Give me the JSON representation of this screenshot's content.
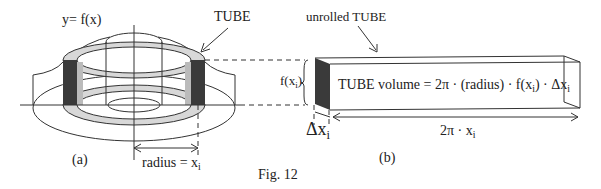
{
  "figure": {
    "caption": "Fig. 12",
    "panel_a": {
      "label": "(a)",
      "function_label": "y= f(x)",
      "tube_label": "TUBE",
      "radius_label": "radius = ",
      "radius_var": "x",
      "radius_sub": "i",
      "height_label": "f(x",
      "height_sub": "i",
      "height_close": ")"
    },
    "panel_b": {
      "label": "(b)",
      "title": "unrolled TUBE",
      "formula": "TUBE volume  =  2π · (radius) · f(x",
      "formula_sub1": "i",
      "formula_mid": ") · Δx",
      "formula_sub2": "i",
      "thickness_label": "Δx",
      "thickness_sub": "i",
      "length_label": "2π · x",
      "length_sub": "i"
    },
    "colors": {
      "line": "#333333",
      "tube_dark": "#3a3a3a",
      "tube_light": "#cfcfcf",
      "ring_fill": "#dcdcdc"
    }
  }
}
